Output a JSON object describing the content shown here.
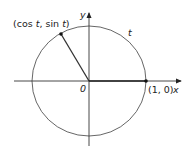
{
  "diagram": {
    "type": "unit-circle",
    "labels": {
      "point_label": "(cos t, sin t)",
      "point_label_parts": [
        "(cos ",
        "t",
        ", sin ",
        "t",
        ")"
      ],
      "arc_label": "t",
      "origin_label": "0",
      "right_point_label": "(1, 0)",
      "x_axis_label": "x",
      "y_axis_label": "y"
    },
    "colors": {
      "circle": "#555555",
      "axes": "#333333",
      "radius": "#333333",
      "points": "#111111"
    }
  }
}
